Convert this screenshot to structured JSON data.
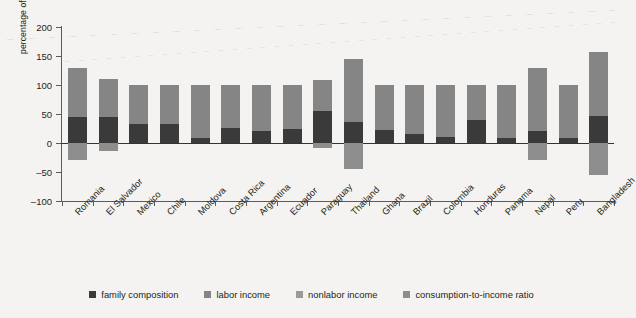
{
  "chart_data": {
    "type": "bar",
    "title": "",
    "subtitle": "",
    "xlabel": "",
    "ylabel": "percentage of total change in extreme poverty",
    "ylim": [
      -100,
      200
    ],
    "yticks": [
      -100,
      -50,
      0,
      50,
      100,
      150,
      200
    ],
    "ytick_labels": [
      "–100",
      "–50",
      "0",
      "50",
      "100",
      "150",
      "200"
    ],
    "grid": false,
    "stacked": true,
    "legend_position": "bottom",
    "legend": [
      {
        "label": "family composition",
        "color": "#3a3a3a"
      },
      {
        "label": "labor income",
        "color": "#858585"
      },
      {
        "label": "nonlabor income",
        "color": "#9a9a9a"
      },
      {
        "label": "consumption-to-income ratio",
        "color": "#8d8d8d"
      }
    ],
    "categories": [
      "Romania",
      "El Salvador",
      "Mexico",
      "Chile",
      "Moldova",
      "Costa Rica",
      "Argentina",
      "Ecuador",
      "Paraguay",
      "Thailand",
      "Ghana",
      "Brazil",
      "Colombia",
      "Honduras",
      "Panama",
      "Nepal",
      "Peru",
      "Bangladesh"
    ],
    "series": [
      {
        "name": "family composition",
        "color": "#3a3a3a",
        "values": [
          45,
          44,
          32,
          32,
          8,
          26,
          21,
          25,
          55,
          36,
          22,
          16,
          11,
          39,
          9,
          21,
          8,
          47
        ]
      },
      {
        "name": "labor income",
        "color": "#858585",
        "values": [
          85,
          67,
          68,
          68,
          92,
          74,
          79,
          75,
          53,
          109,
          78,
          84,
          89,
          61,
          91,
          109,
          92,
          110
        ]
      },
      {
        "name": "nonlabor income",
        "color": "#9a9a9a",
        "values": [
          0,
          0,
          0,
          0,
          0,
          0,
          0,
          0,
          0,
          0,
          0,
          0,
          0,
          0,
          0,
          0,
          0,
          0
        ]
      },
      {
        "name": "consumption-to-income ratio",
        "color": "#8d8d8d",
        "values": [
          -30,
          -14,
          0,
          0,
          0,
          0,
          0,
          0,
          -8,
          -45,
          0,
          0,
          0,
          0,
          0,
          -29,
          0,
          -55
        ]
      }
    ],
    "bar_totals_positive": [
      130,
      111,
      100,
      100,
      100,
      100,
      100,
      100,
      108,
      145,
      100,
      100,
      100,
      100,
      100,
      130,
      100,
      157
    ],
    "bar_totals_negative": [
      -30,
      -14,
      0,
      0,
      0,
      0,
      0,
      0,
      -8,
      -45,
      0,
      0,
      0,
      0,
      0,
      -29,
      0,
      -55
    ]
  }
}
